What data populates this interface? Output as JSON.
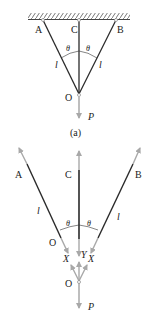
{
  "figure_a": {
    "points": {
      "A": "A",
      "B": "B",
      "C": "C",
      "O": "O"
    },
    "angle_left": "θ",
    "angle_right": "θ",
    "length_left": "l",
    "length_right": "l",
    "load": "P",
    "caption": "(a)"
  },
  "figure_b": {
    "points": {
      "A": "A",
      "B": "B",
      "C": "C",
      "O_bar": "O",
      "O_node": "O"
    },
    "angle_left": "θ",
    "angle_right": "θ",
    "length_left": "l",
    "length_right": "l",
    "force_left": "X",
    "force_center": "Y",
    "force_right": "X",
    "load": "P"
  },
  "colors": {
    "bar": "#2a2a2a",
    "force": "#a8a8a8",
    "ceiling": "#555555"
  }
}
